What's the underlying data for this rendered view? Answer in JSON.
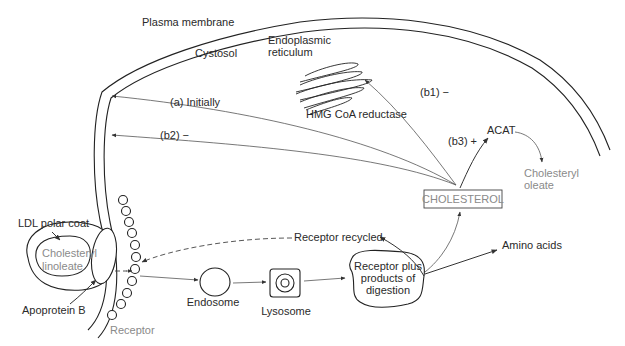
{
  "diagram": {
    "regions": {
      "plasma_membrane": "Plasma membrane",
      "cytosol": "Cystosol",
      "er_line1": "Endoplasmic",
      "er_line2": "reticulum",
      "hmg": "HMG CoA reductase"
    },
    "ldl": {
      "polar_coat": "LDL polar coat",
      "core_line1": "Cholesteryl",
      "core_line2": "linoleate",
      "apoprotein": "Apoprotein B",
      "receptor": "Receptor"
    },
    "pathway": {
      "endosome": "Endosome",
      "lysosome": "Lysosome",
      "digestion_line1": "Receptor plus",
      "digestion_line2": "products of",
      "digestion_line3": "digestion",
      "receptor_recycled": "Receptor recycled",
      "amino_acids": "Amino acids",
      "cholesterol": "CHOLESTEROL",
      "acat": "ACAT",
      "oleate_line1": "Cholesteryl",
      "oleate_line2": "oleate"
    },
    "regulation": {
      "a": "(a) Initially",
      "b1": "(b1) −",
      "b2": "(b2)   −",
      "b3": "(b3) +"
    },
    "colors": {
      "line": "#222222",
      "text": "#2a2a2a",
      "muted_text": "#8a8a8a"
    }
  }
}
